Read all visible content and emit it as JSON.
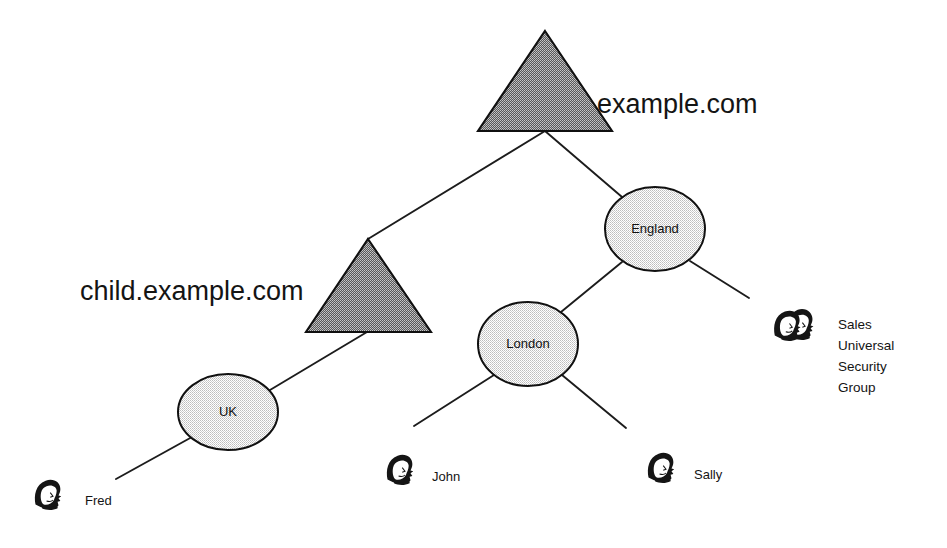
{
  "diagram": {
    "background_color": "#ffffff",
    "line_color": "#1c1c1c",
    "domain_fill": "#7d7d7d",
    "site_fill": "#d9d9d9",
    "domains": [
      {
        "id": "example-com",
        "label": "example.com",
        "shape": "triangle",
        "fill": "#7d7d7d",
        "apex": {
          "x": 545,
          "y": 31
        },
        "base_left": {
          "x": 478,
          "y": 131
        },
        "base_right": {
          "x": 612,
          "y": 131
        },
        "label_x": 597,
        "label_y": 113
      },
      {
        "id": "child-example-com",
        "label": "child.example.com",
        "shape": "triangle",
        "fill": "#7d7d7d",
        "apex": {
          "x": 368,
          "y": 239
        },
        "base_left": {
          "x": 306,
          "y": 332
        },
        "base_right": {
          "x": 431,
          "y": 332
        },
        "label_x": 80,
        "label_y": 300
      }
    ],
    "sites": [
      {
        "id": "england",
        "label": "England",
        "shape": "ellipse",
        "fill": "#d9d9d9",
        "cx": 655,
        "cy": 229,
        "rx": 50,
        "ry": 42
      },
      {
        "id": "london",
        "label": "London",
        "shape": "ellipse",
        "fill": "#d9d9d9",
        "cx": 528,
        "cy": 344,
        "rx": 50,
        "ry": 42
      },
      {
        "id": "uk",
        "label": "UK",
        "shape": "ellipse",
        "fill": "#d9d9d9",
        "cx": 228,
        "cy": 412,
        "rx": 50,
        "ry": 38
      }
    ],
    "people": [
      {
        "id": "fred",
        "label": "Fred",
        "icon": "user-icon",
        "icon_x": 30,
        "icon_y": 477,
        "label_x": 85,
        "label_y": 505
      },
      {
        "id": "john",
        "label": "John",
        "icon": "user-icon",
        "icon_x": 382,
        "icon_y": 452,
        "label_x": 432,
        "label_y": 481
      },
      {
        "id": "sally",
        "label": "Sally",
        "icon": "user-icon",
        "icon_x": 643,
        "icon_y": 450,
        "label_x": 694,
        "label_y": 479
      }
    ],
    "groups": [
      {
        "id": "sales-universal-security-group",
        "icon": "group-icon",
        "icon_x": 772,
        "icon_y": 307,
        "label_x": 838,
        "label_y": 318,
        "lines": [
          "Sales",
          "Universal",
          "Security",
          "Group"
        ]
      }
    ],
    "edges": [
      {
        "id": "example-to-child",
        "from": "example-com",
        "to": "child-example-com",
        "x1": 545,
        "y1": 131,
        "x2": 368,
        "y2": 239
      },
      {
        "id": "example-to-england",
        "from": "example-com",
        "to": "england",
        "x1": 545,
        "y1": 131,
        "x2": 622,
        "y2": 196
      },
      {
        "id": "child-to-uk",
        "from": "child-example-com",
        "to": "uk",
        "x1": 367,
        "y1": 332,
        "x2": 270,
        "y2": 390
      },
      {
        "id": "uk-to-fred",
        "from": "uk",
        "to": "fred",
        "x1": 192,
        "y1": 437,
        "x2": 116,
        "y2": 479
      },
      {
        "id": "england-to-london",
        "from": "england",
        "to": "london",
        "x1": 622,
        "y1": 262,
        "x2": 561,
        "y2": 312
      },
      {
        "id": "england-to-sales",
        "from": "england",
        "to": "sales-universal-security-group",
        "x1": 690,
        "y1": 261,
        "x2": 749,
        "y2": 298
      },
      {
        "id": "london-to-john",
        "from": "london",
        "to": "john",
        "x1": 494,
        "y1": 375,
        "x2": 414,
        "y2": 426
      },
      {
        "id": "london-to-sally",
        "from": "london",
        "to": "sally",
        "x1": 562,
        "y1": 375,
        "x2": 626,
        "y2": 428
      }
    ]
  }
}
